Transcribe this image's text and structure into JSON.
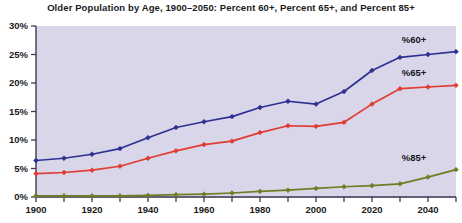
{
  "chart_data": {
    "type": "line",
    "title": "Older Population by Age, 1900–2050: Percent 60+, Percent 65+, and Percent 85+",
    "xlabel": "",
    "ylabel": "",
    "xlim": [
      1900,
      2050
    ],
    "ylim": [
      0,
      30
    ],
    "ytick_labels": [
      "0%",
      "5%",
      "10%",
      "15%",
      "20%",
      "25%",
      "30%"
    ],
    "ytick_values": [
      0,
      5,
      10,
      15,
      20,
      25,
      30
    ],
    "xtick_labels": [
      "1900",
      "1920",
      "1940",
      "1960",
      "1980",
      "2000",
      "2020",
      "2040"
    ],
    "xtick_values": [
      1900,
      1920,
      1940,
      1960,
      1980,
      2000,
      2020,
      2040
    ],
    "xminor_values": [
      1910,
      1930,
      1950,
      1970,
      1990,
      2010,
      2030,
      2050
    ],
    "grid": false,
    "legend_position": "inline-right",
    "x": [
      1900,
      1910,
      1920,
      1930,
      1940,
      1950,
      1960,
      1970,
      1980,
      1990,
      2000,
      2010,
      2020,
      2030,
      2040,
      2050
    ],
    "series": [
      {
        "name": "%60+",
        "label": "%60+",
        "color": "#2e3192",
        "marker": "diamond",
        "values": [
          6.4,
          6.8,
          7.5,
          8.5,
          10.4,
          12.2,
          13.2,
          14.1,
          15.7,
          16.8,
          16.3,
          18.5,
          22.2,
          24.5,
          25.0,
          25.5
        ]
      },
      {
        "name": "%65+",
        "label": "%65+",
        "color": "#e03c31",
        "marker": "diamond",
        "values": [
          4.1,
          4.3,
          4.7,
          5.4,
          6.8,
          8.1,
          9.2,
          9.8,
          11.3,
          12.5,
          12.4,
          13.1,
          16.3,
          19.0,
          19.3,
          19.6
        ]
      },
      {
        "name": "%85+",
        "label": "%85+",
        "color": "#6f7d23",
        "marker": "diamond",
        "values": [
          0.2,
          0.2,
          0.2,
          0.2,
          0.3,
          0.4,
          0.5,
          0.7,
          1.0,
          1.2,
          1.5,
          1.8,
          2.0,
          2.3,
          3.5,
          4.8
        ]
      }
    ],
    "colors": {
      "plot_background": "#d9d6ea",
      "axis": "#3b3b52",
      "text": "#1b1b1b",
      "series_60": "#2e3192",
      "series_65": "#e03c31",
      "series_85": "#6f7d23"
    }
  }
}
